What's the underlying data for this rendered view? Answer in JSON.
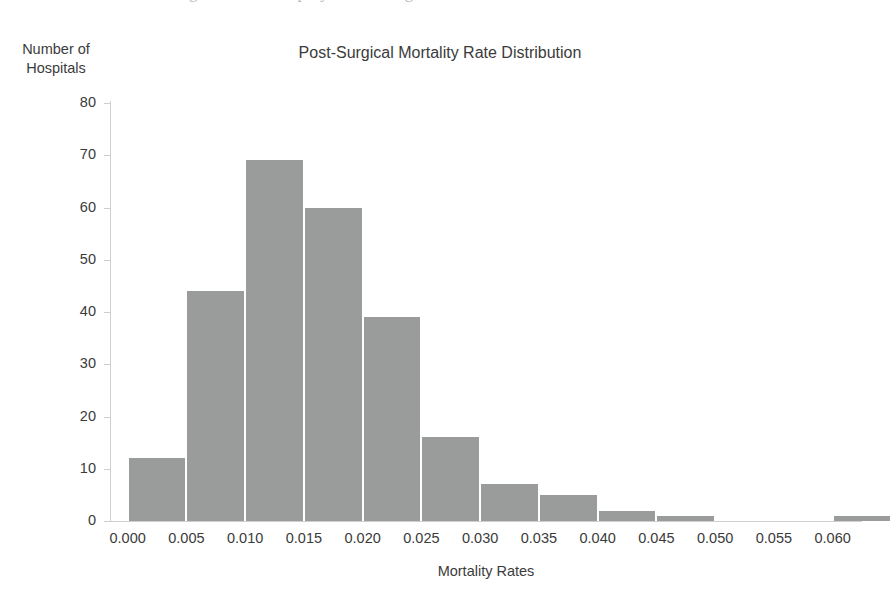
{
  "page": {
    "bleed_text_above": "the figure below displays the histogram"
  },
  "chart": {
    "title": "Post-Surgical Mortality Rate Distribution",
    "ylabel_line1": "Number of",
    "ylabel_line2": "Hospitals",
    "xlabel": "Mortality Rates",
    "bar_color": "#9a9b9b",
    "axis_color": "#cfcfcf",
    "text_color": "#3b3b3b",
    "yticks": [
      "80",
      "70",
      "60",
      "50",
      "40",
      "30",
      "20",
      "10",
      "0"
    ],
    "xticks": [
      "0.000",
      "0.005",
      "0.010",
      "0.015",
      "0.020",
      "0.025",
      "0.030",
      "0.035",
      "0.040",
      "0.045",
      "0.050",
      "0.055",
      "0.060"
    ]
  },
  "chart_data": {
    "type": "bar",
    "chart_subtype": "histogram",
    "title": "Post-Surgical Mortality Rate Distribution",
    "xlabel": "Mortality Rates",
    "ylabel": "Number of Hospitals",
    "xlim": [
      -0.0015,
      0.0625
    ],
    "ylim": [
      0,
      80
    ],
    "ytick_values": [
      0,
      10,
      20,
      30,
      40,
      50,
      60,
      70,
      80
    ],
    "xtick_values": [
      0.0,
      0.005,
      0.01,
      0.015,
      0.02,
      0.025,
      0.03,
      0.035,
      0.04,
      0.045,
      0.05,
      0.055,
      0.06
    ],
    "bin_width": 0.005,
    "grid": false,
    "legend": false,
    "bin_edges": [
      0.0,
      0.005,
      0.01,
      0.015,
      0.02,
      0.025,
      0.03,
      0.035,
      0.04,
      0.045,
      0.05,
      0.055,
      0.06,
      0.065
    ],
    "categories": [
      "0.000-0.005",
      "0.005-0.010",
      "0.010-0.015",
      "0.015-0.020",
      "0.020-0.025",
      "0.025-0.030",
      "0.030-0.035",
      "0.035-0.040",
      "0.040-0.045",
      "0.045-0.050",
      "0.050-0.055",
      "0.055-0.060",
      "0.060-0.065"
    ],
    "values": [
      12,
      44,
      69,
      60,
      39,
      16,
      7,
      5,
      2,
      1,
      0,
      0,
      1
    ]
  }
}
